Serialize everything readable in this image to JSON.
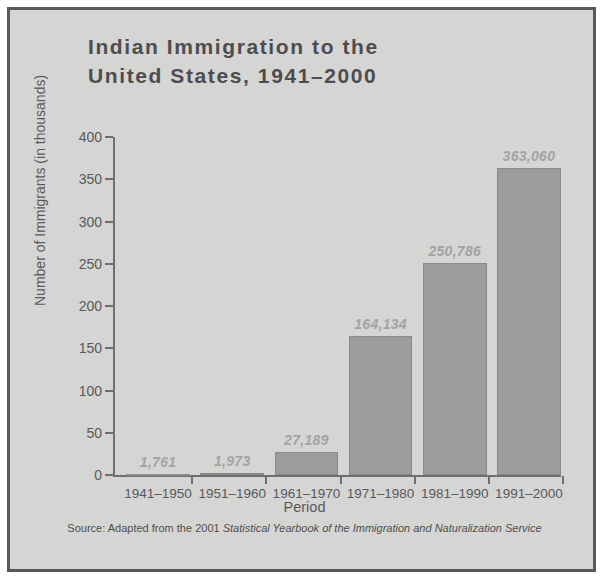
{
  "figure": {
    "title": "Indian Immigration to the\nUnited States, 1941–2000",
    "source_prefix": "Source: Adapted from the 2001 ",
    "source_title": "Statistical Yearbook of the Immigration and Naturalization Service"
  },
  "colors": {
    "panel_background": "#d5d5d3",
    "frame_border": "#58595b",
    "bar_fill": "#9c9c9c",
    "bar_stroke": "#8a8a8a",
    "axis_line": "#6e6f71",
    "title_text": "#4d4d4f",
    "axis_text": "#58595b",
    "value_label_text": "#a3a3a3"
  },
  "chart_data": {
    "type": "bar",
    "title": "Indian Immigration to the United States, 1941–2000",
    "xlabel": "Period",
    "ylabel": "Number of Immigrants (in thousands)",
    "categories": [
      "1941–1950",
      "1951–1960",
      "1961–1970",
      "1971–1980",
      "1981–1990",
      "1991–2000"
    ],
    "values": [
      1.761,
      1.973,
      27.189,
      164.134,
      250.786,
      363.06
    ],
    "value_labels": [
      "1,761",
      "1,973",
      "27,189",
      "164,134",
      "250,786",
      "363,060"
    ],
    "ylim": [
      0,
      400
    ],
    "yticks": [
      0,
      50,
      100,
      150,
      200,
      250,
      300,
      350,
      400
    ],
    "ytick_labels": [
      "0",
      "50",
      "100",
      "150",
      "200",
      "250",
      "300",
      "350",
      "400"
    ],
    "grid": false,
    "legend": false,
    "units": "thousands of immigrants"
  }
}
